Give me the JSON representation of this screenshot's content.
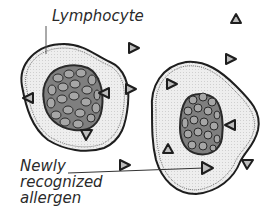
{
  "labels": {
    "lymphocyte": "Lymphocyte",
    "allergen_line1": "Newly",
    "allergen_line2": "recognized",
    "allergen_line3": "allergen"
  },
  "colors": {
    "outline": "#1e1e1e",
    "cytoplasm": "#ececec",
    "nucleus": "#7f7f7f",
    "nucleus_cells": "#a6a6a6",
    "triangle_fill": "#bdbdbd",
    "label": "#2a2a2a"
  },
  "cells": [
    {
      "name": "left-lymphocyte"
    },
    {
      "name": "right-lymphocyte"
    }
  ],
  "allergen_triangles": [
    {
      "x": 236,
      "y": 18,
      "dir": "up",
      "location": "free"
    },
    {
      "x": 133,
      "y": 48,
      "dir": "right",
      "location": "free"
    },
    {
      "x": 230,
      "y": 59,
      "dir": "right",
      "location": "free"
    },
    {
      "x": 130,
      "y": 89,
      "dir": "right",
      "location": "free"
    },
    {
      "x": 125,
      "y": 165,
      "dir": "right",
      "location": "free"
    },
    {
      "x": 248,
      "y": 164,
      "dir": "down",
      "location": "free"
    },
    {
      "x": 28,
      "y": 98,
      "dir": "left",
      "location": "left-cell"
    },
    {
      "x": 104,
      "y": 93,
      "dir": "left",
      "location": "left-cell"
    },
    {
      "x": 87,
      "y": 135,
      "dir": "down",
      "location": "left-cell"
    },
    {
      "x": 172,
      "y": 84,
      "dir": "right",
      "location": "right-cell"
    },
    {
      "x": 230,
      "y": 125,
      "dir": "left",
      "location": "right-cell"
    },
    {
      "x": 168,
      "y": 148,
      "dir": "up",
      "location": "right-cell"
    },
    {
      "x": 208,
      "y": 168,
      "dir": "right",
      "location": "right-cell"
    }
  ]
}
